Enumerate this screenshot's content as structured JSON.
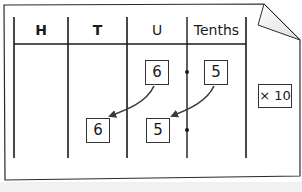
{
  "diagram": {
    "type": "place-value-chart",
    "columns": [
      {
        "label": "H",
        "name": "hundreds"
      },
      {
        "label": "T",
        "name": "tens"
      },
      {
        "label": "U",
        "name": "units"
      },
      {
        "label": "Tenths",
        "name": "tenths"
      }
    ],
    "before": {
      "units": "6",
      "tenths": "5"
    },
    "after": {
      "tens": "6",
      "units": "5"
    },
    "operation": "× 10",
    "decimal_point": "•",
    "colors": {
      "line": "#1a1a1a",
      "arrow": "#3a3a3a",
      "background": "#ffffff",
      "fold": "#e6e6e6"
    }
  }
}
